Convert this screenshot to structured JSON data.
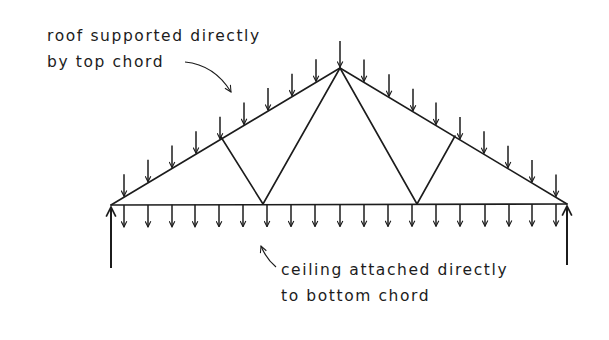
{
  "diagram": {
    "colors": {
      "ink": "#1c1c1c",
      "background": "#ffffff"
    },
    "annotations": {
      "roof": {
        "lines": [
          "roof supported directly",
          "by top chord"
        ],
        "text": "roof supported directly by top chord",
        "pointer": "curved-arrow-to-top-chord"
      },
      "ceiling": {
        "lines": [
          "ceiling attached directly",
          "to bottom chord"
        ],
        "text": "ceiling attached directly to bottom chord",
        "pointer": "curved-arrow-to-bottom-chord"
      }
    },
    "truss": {
      "type": "Fink (W) truss",
      "left_support": [
        111,
        205
      ],
      "apex": [
        340,
        68
      ],
      "right_support": [
        567,
        204
      ],
      "top_chord_web_nodes": [
        [
          221,
          137
        ],
        [
          455,
          136
        ]
      ],
      "bottom_chord_web_nodes": [
        [
          263,
          204
        ],
        [
          417,
          204
        ]
      ],
      "members": [
        "top-chord-left",
        "top-chord-right",
        "bottom-chord",
        "web-left-short",
        "web-left-long",
        "web-right-long",
        "web-right-short"
      ]
    },
    "loads": {
      "top_chord_arrow_x": [
        124,
        148,
        172,
        196,
        220,
        244,
        268,
        292,
        316,
        340,
        364,
        389,
        413,
        436,
        460,
        484,
        508,
        532,
        556
      ],
      "bottom_chord_arrow_x": [
        124,
        148,
        172,
        195,
        219,
        243,
        267,
        291,
        315,
        340,
        364,
        388,
        412,
        436,
        460,
        485,
        509,
        532,
        556
      ],
      "arrow_length": 22,
      "direction": "down"
    },
    "reactions": {
      "left": {
        "x": 111,
        "from_y": 268,
        "to_y": 207,
        "direction": "up"
      },
      "right": {
        "x": 567,
        "from_y": 265,
        "to_y": 206,
        "direction": "up"
      }
    }
  }
}
